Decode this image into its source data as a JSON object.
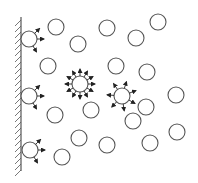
{
  "diagram": {
    "title": "",
    "colors": {
      "stroke": "#555555",
      "arrow": "#222222",
      "background": "#ffffff"
    },
    "wall": {
      "x": 21,
      "y1": 17,
      "y2": 171,
      "hatch_spacing": 6,
      "hatch_len": 6
    },
    "circle_radius": 8,
    "wall_circles": [
      {
        "cx": 29,
        "cy": 39
      },
      {
        "cx": 29,
        "cy": 96
      },
      {
        "cx": 30,
        "cy": 150
      }
    ],
    "emitting_circles": [
      {
        "cx": 80,
        "cy": 84,
        "rays": 12,
        "ray_len": 9
      },
      {
        "cx": 122,
        "cy": 96,
        "rays": 7,
        "ray_len": 9
      }
    ],
    "free_circles": [
      {
        "cx": 56,
        "cy": 27
      },
      {
        "cx": 78,
        "cy": 44
      },
      {
        "cx": 48,
        "cy": 66
      },
      {
        "cx": 107,
        "cy": 28
      },
      {
        "cx": 136,
        "cy": 38
      },
      {
        "cx": 158,
        "cy": 22
      },
      {
        "cx": 116,
        "cy": 66
      },
      {
        "cx": 147,
        "cy": 72
      },
      {
        "cx": 55,
        "cy": 115
      },
      {
        "cx": 91,
        "cy": 110
      },
      {
        "cx": 133,
        "cy": 121
      },
      {
        "cx": 176,
        "cy": 95
      },
      {
        "cx": 146,
        "cy": 107
      },
      {
        "cx": 177,
        "cy": 132
      },
      {
        "cx": 79,
        "cy": 138
      },
      {
        "cx": 107,
        "cy": 145
      },
      {
        "cx": 150,
        "cy": 143
      },
      {
        "cx": 62,
        "cy": 157
      }
    ]
  }
}
